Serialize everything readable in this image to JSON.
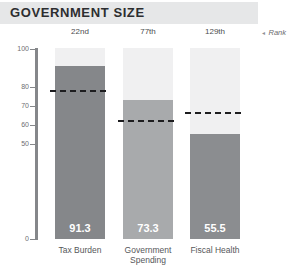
{
  "header": {
    "title": "GOVERNMENT SIZE"
  },
  "rank_legend": {
    "arrow": "◂",
    "label": "Rank"
  },
  "chart_data": {
    "type": "bar",
    "title": "GOVERNMENT SIZE",
    "categories": [
      "Tax Burden",
      "Government Spending",
      "Fiscal Health"
    ],
    "values": [
      91.3,
      73.3,
      55.5
    ],
    "value_labels": [
      "91.3",
      "73.3",
      "55.5"
    ],
    "ranks": [
      "22nd",
      "77th",
      "129th"
    ],
    "reference_lines": [
      78,
      62,
      66.5
    ],
    "reference_line_style": "dashed-black",
    "ylim": [
      0,
      100
    ],
    "yticks": [
      100,
      80,
      70,
      60,
      50,
      0
    ],
    "grid": false,
    "legend_position": "top-right",
    "colors": {
      "header_bg": "#e6e7e8",
      "title_text": "#2d2e30",
      "bar_colors": [
        "#85878a",
        "#a8aaac",
        "#8b8d90"
      ],
      "track_color": "#f0f0f1",
      "axis_color": "#85878a",
      "value_label_color": "#ffffff",
      "reference_line_color": "#1d1d1f"
    }
  }
}
